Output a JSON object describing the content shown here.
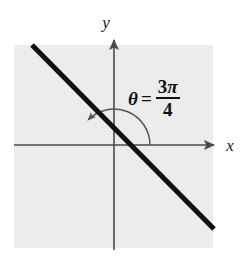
{
  "figure": {
    "type": "math-diagram",
    "background_color": "#ffffff",
    "plot_area_color": "#ececec"
  },
  "axes": {
    "x_label": "x",
    "y_label": "y",
    "axis_color": "#4a4a4a",
    "origin": {
      "x": 114,
      "y": 145
    },
    "x_axis": {
      "start_x": 14,
      "end_x": 218,
      "y": 145,
      "has_arrow": true
    },
    "y_axis": {
      "x": 114,
      "start_y": 36,
      "end_y": 250,
      "has_arrow": true
    }
  },
  "line": {
    "name": "terminal-line",
    "color": "#111111",
    "width": 5,
    "start": {
      "x": 32,
      "y": 45
    },
    "end": {
      "x": 214,
      "y": 229
    },
    "slope": -1
  },
  "angle": {
    "symbol": "θ",
    "equals": "=",
    "numerator": "3π",
    "numerator_coefficient": "3",
    "numerator_symbol": "π",
    "denominator": "4",
    "full_label": "θ = 3π/4",
    "degrees": 135,
    "arc_radius": 36,
    "arc_color": "#555555",
    "arc_start_degrees": 0,
    "arc_end_degrees": 135,
    "arrow_at_end": true
  },
  "plot_area": {
    "left": 14,
    "top": 45,
    "width": 199,
    "height": 203
  },
  "colors": {
    "line": "#111111",
    "axis": "#4a4a4a",
    "arc": "#555555",
    "label": "#111111",
    "panel": "#ececec",
    "page": "#ffffff"
  }
}
